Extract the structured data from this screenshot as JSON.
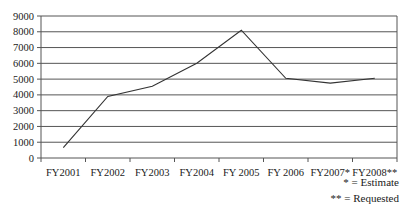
{
  "chart_data": {
    "type": "line",
    "title": "",
    "xlabel": "",
    "ylabel": "",
    "categories": [
      "FY2001",
      "FY2002",
      "FY2003",
      "FY2004",
      "FY 2005",
      "FY 2006",
      "FY2007*",
      "FY2008**"
    ],
    "series": [
      {
        "name": "Value",
        "values": [
          650,
          3900,
          4550,
          6000,
          8100,
          5050,
          4750,
          5050
        ]
      }
    ],
    "ylim": [
      0,
      9000
    ],
    "yticks": [
      0,
      1000,
      2000,
      3000,
      4000,
      5000,
      6000,
      7000,
      8000,
      9000
    ],
    "grid": true,
    "legend": null,
    "annotations": [
      "* = Estimate",
      "** = Requested"
    ]
  },
  "notes": {
    "estimate": "* = Estimate",
    "requested": "** = Requested"
  },
  "colors": {
    "line": "#333333",
    "grid": "#555555",
    "axis": "#555555"
  }
}
